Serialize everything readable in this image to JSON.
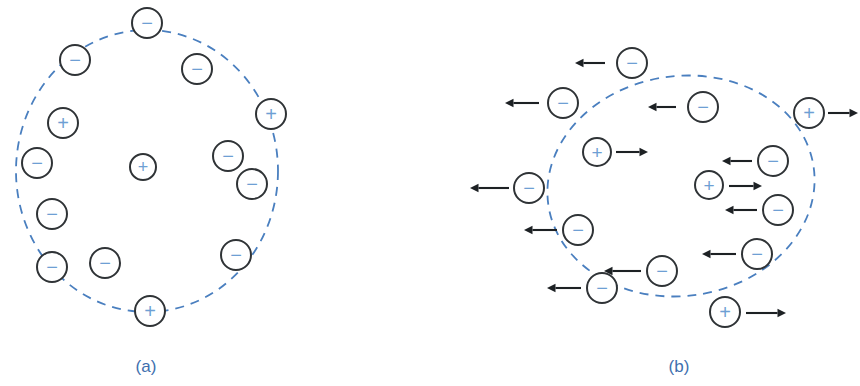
{
  "figure": {
    "background_color": "#ffffff",
    "boundary_color": "#4a7fbf",
    "charge_outline_color": "#2f3336",
    "charge_symbol_color": "#6e9fd4",
    "arrow_color": "#1d2124",
    "caption_color": "#3e6fae"
  },
  "panels": [
    {
      "id": "a",
      "caption": "(a)",
      "caption_x": 146,
      "caption_y": 372,
      "boundary": {
        "shape": "ellipse",
        "cx": 147,
        "cy": 171,
        "rx": 131,
        "ry": 141,
        "rotation": 0
      },
      "charges": [
        {
          "sign": "−",
          "label": "minus",
          "x": 147,
          "y": 23,
          "r": 15
        },
        {
          "sign": "−",
          "label": "minus",
          "x": 75,
          "y": 60,
          "r": 15
        },
        {
          "sign": "−",
          "label": "minus",
          "x": 197,
          "y": 69,
          "r": 15
        },
        {
          "sign": "+",
          "label": "plus",
          "x": 271,
          "y": 114,
          "r": 15
        },
        {
          "sign": "+",
          "label": "plus",
          "x": 63,
          "y": 123,
          "r": 15
        },
        {
          "sign": "−",
          "label": "minus",
          "x": 37,
          "y": 163,
          "r": 15
        },
        {
          "sign": "+",
          "label": "plus",
          "x": 143,
          "y": 167,
          "r": 13
        },
        {
          "sign": "−",
          "label": "minus",
          "x": 228,
          "y": 156,
          "r": 15
        },
        {
          "sign": "−",
          "label": "minus",
          "x": 252,
          "y": 184,
          "r": 15
        },
        {
          "sign": "−",
          "label": "minus",
          "x": 52,
          "y": 214,
          "r": 15
        },
        {
          "sign": "−",
          "label": "minus",
          "x": 52,
          "y": 267,
          "r": 15
        },
        {
          "sign": "−",
          "label": "minus",
          "x": 105,
          "y": 263,
          "r": 15
        },
        {
          "sign": "−",
          "label": "minus",
          "x": 236,
          "y": 255,
          "r": 15
        },
        {
          "sign": "+",
          "label": "plus",
          "x": 150,
          "y": 311,
          "r": 15
        }
      ],
      "arrows": []
    },
    {
      "id": "b",
      "caption": "(b)",
      "caption_x": 679,
      "caption_y": 372,
      "boundary": {
        "shape": "ellipse",
        "cx": 681,
        "cy": 186,
        "rx": 134,
        "ry": 110,
        "rotation": -8
      },
      "charges": [
        {
          "sign": "−",
          "label": "minus",
          "x": 632,
          "y": 63,
          "r": 15
        },
        {
          "sign": "−",
          "label": "minus",
          "x": 563,
          "y": 103,
          "r": 15
        },
        {
          "sign": "−",
          "label": "minus",
          "x": 703,
          "y": 107,
          "r": 15
        },
        {
          "sign": "+",
          "label": "plus",
          "x": 809,
          "y": 113,
          "r": 15
        },
        {
          "sign": "+",
          "label": "plus",
          "x": 597,
          "y": 152,
          "r": 14
        },
        {
          "sign": "−",
          "label": "minus",
          "x": 773,
          "y": 161,
          "r": 15
        },
        {
          "sign": "−",
          "label": "minus",
          "x": 529,
          "y": 188,
          "r": 15
        },
        {
          "sign": "+",
          "label": "plus",
          "x": 709,
          "y": 185,
          "r": 14
        },
        {
          "sign": "−",
          "label": "minus",
          "x": 778,
          "y": 210,
          "r": 15
        },
        {
          "sign": "−",
          "label": "minus",
          "x": 578,
          "y": 230,
          "r": 15
        },
        {
          "sign": "−",
          "label": "minus",
          "x": 757,
          "y": 254,
          "r": 15
        },
        {
          "sign": "−",
          "label": "minus",
          "x": 662,
          "y": 271,
          "r": 15
        },
        {
          "sign": "−",
          "label": "minus",
          "x": 602,
          "y": 288,
          "r": 15
        },
        {
          "sign": "+",
          "label": "plus",
          "x": 725,
          "y": 312,
          "r": 15
        }
      ],
      "arrows": [
        {
          "direction": "left",
          "x1": 605,
          "x2": 575,
          "y": 63
        },
        {
          "direction": "left",
          "x1": 539,
          "x2": 505,
          "y": 103
        },
        {
          "direction": "left",
          "x1": 676,
          "x2": 648,
          "y": 107
        },
        {
          "direction": "right",
          "x1": 828,
          "x2": 858,
          "y": 113
        },
        {
          "direction": "right",
          "x1": 616,
          "x2": 648,
          "y": 152
        },
        {
          "direction": "left",
          "x1": 752,
          "x2": 722,
          "y": 161
        },
        {
          "direction": "left",
          "x1": 509,
          "x2": 470,
          "y": 188
        },
        {
          "direction": "right",
          "x1": 729,
          "x2": 762,
          "y": 186
        },
        {
          "direction": "left",
          "x1": 757,
          "x2": 725,
          "y": 210
        },
        {
          "direction": "left",
          "x1": 557,
          "x2": 524,
          "y": 230
        },
        {
          "direction": "left",
          "x1": 736,
          "x2": 702,
          "y": 254
        },
        {
          "direction": "left",
          "x1": 641,
          "x2": 604,
          "y": 271
        },
        {
          "direction": "left",
          "x1": 581,
          "x2": 547,
          "y": 288
        },
        {
          "direction": "right",
          "x1": 746,
          "x2": 786,
          "y": 313
        }
      ]
    }
  ]
}
